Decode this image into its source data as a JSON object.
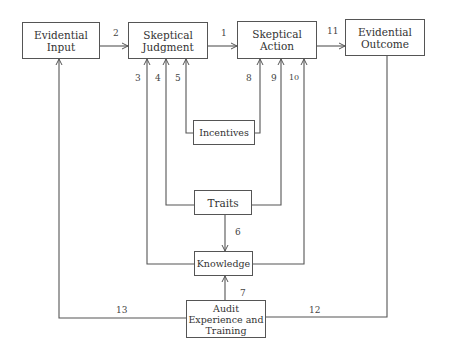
{
  "boxes": {
    "evidential_input": "Evidential\nInput",
    "skeptical_judgment": "Skeptical\nJudgment",
    "skeptical_action": "Skeptical\nAction",
    "evidential_outcome": "Evidential\nOutcome",
    "incentives": "Incentives",
    "traits": "Traits",
    "knowledge": "Knowledge",
    "audit": "Audit\nExperience and\nTraining"
  },
  "labels": {
    "l1": "1",
    "l2": "2",
    "l3": "3",
    "l4": "4",
    "l5": "5",
    "l6": "6",
    "l7": "7",
    "l8": "8",
    "l9": "9",
    "l10": "10",
    "l11": "11",
    "l12": "12",
    "l13": "13"
  },
  "colors": {
    "line": "#555555",
    "text": "#333333",
    "background": "#ffffff"
  }
}
